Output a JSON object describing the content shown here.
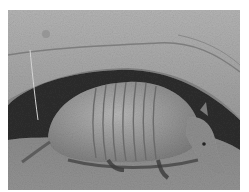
{
  "image": {
    "subject": "armadillo",
    "description": "Grayscale photograph of an armadillo resting beneath a rocky burrow overhang",
    "colors": {
      "background": "#ffffff",
      "rock": "#a9a9a9",
      "rock_light": "#bdbdbd",
      "burrow_shadow": "#2a2a2a",
      "shell": "#9a9a9a",
      "shell_band": "#6e6e6e",
      "head": "#8e8e8e",
      "ground": "#8a8a8a"
    }
  }
}
